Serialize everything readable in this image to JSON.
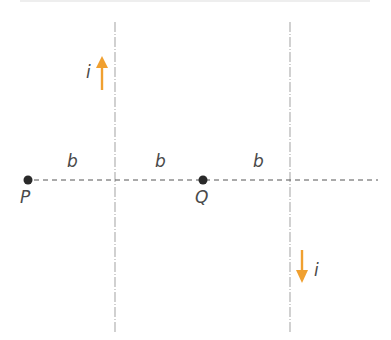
{
  "diagram": {
    "points": [
      {
        "label": "P",
        "x": 28,
        "y": 180
      },
      {
        "label": "Q",
        "x": 203,
        "y": 180
      }
    ],
    "spacing_labels": [
      "b",
      "b",
      "b"
    ],
    "wires": [
      {
        "x": 115,
        "current_label": "i",
        "direction": "up"
      },
      {
        "x": 290,
        "current_label": "i",
        "direction": "down"
      }
    ],
    "colors": {
      "arrow": "#f0a030",
      "wire": "#b8b8b8",
      "dashed_line": "#555555",
      "point": "#2a2a2a",
      "text": "#4a4a4a"
    }
  }
}
